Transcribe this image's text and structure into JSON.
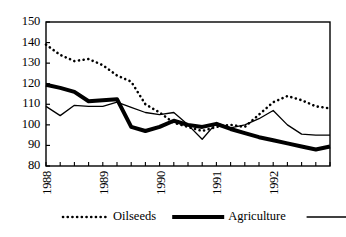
{
  "chart_data": {
    "type": "line",
    "title": "",
    "xlabel": "",
    "ylabel": "",
    "ylim": [
      80,
      150
    ],
    "ytick_labels": [
      "150",
      "140",
      "130",
      "120",
      "110",
      "100",
      "90",
      "80"
    ],
    "ytick_values": [
      150,
      140,
      130,
      120,
      110,
      100,
      90,
      80
    ],
    "xtick_labels": [
      "1988",
      "1989",
      "1990",
      "1991",
      "1992"
    ],
    "xtick_values": [
      1988,
      1989,
      1990,
      1991,
      1992
    ],
    "x": [
      1988.0,
      1988.25,
      1988.5,
      1988.75,
      1989.0,
      1989.25,
      1989.5,
      1989.75,
      1990.0,
      1990.25,
      1990.5,
      1990.75,
      1991.0,
      1991.25,
      1991.5,
      1991.75,
      1992.0,
      1992.25,
      1992.5,
      1992.75,
      1993.0
    ],
    "grid": false,
    "legend_position": "below",
    "series": [
      {
        "name": "Oilseeds",
        "style": "dotted",
        "values": [
          139,
          134,
          131,
          132,
          129,
          124,
          121,
          110,
          106,
          101,
          99,
          97,
          99,
          100,
          99,
          105,
          111,
          114,
          112,
          109,
          108
        ]
      },
      {
        "name": "Agriculture",
        "style": "thick-solid",
        "values": [
          119.5,
          118,
          116,
          111.5,
          112,
          112.5,
          99,
          97,
          99,
          102,
          100,
          99,
          100.5,
          98,
          96,
          94,
          92.5,
          91,
          89.5,
          88,
          89.5
        ]
      },
      {
        "name": "Cereals",
        "style": "thin-solid",
        "values": [
          109,
          104.5,
          109.5,
          109,
          109,
          111,
          108.5,
          106,
          105,
          106,
          100,
          93,
          101,
          98.5,
          100,
          103,
          107,
          100,
          95.5,
          95,
          95
        ]
      }
    ]
  },
  "legend": {
    "items": [
      {
        "label": "Oilseeds",
        "style": "dotted"
      },
      {
        "label": "Agriculture",
        "style": "thick-solid"
      },
      {
        "label": "Cereals",
        "style": "thin-solid"
      }
    ]
  }
}
